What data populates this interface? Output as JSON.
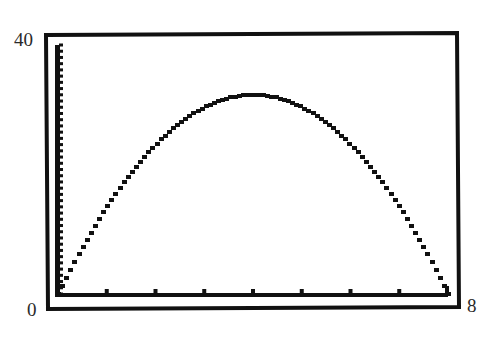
{
  "chart_data": {
    "type": "line",
    "title": "",
    "xlabel": "",
    "ylabel": "",
    "xlim": [
      0,
      8
    ],
    "ylim": [
      0,
      40
    ],
    "x_tick_step": 1,
    "y_tick_step": 1,
    "grid": false,
    "legend": null,
    "function": "y = 16x - 2x^2",
    "x": [
      0,
      0.5,
      1,
      1.5,
      2,
      2.5,
      3,
      3.5,
      4,
      4.5,
      5,
      5.5,
      6,
      6.5,
      7,
      7.5,
      8
    ],
    "series": [
      {
        "name": "y",
        "values": [
          0,
          7.5,
          14,
          19.5,
          24,
          27.5,
          30,
          31.5,
          32,
          31.5,
          30,
          27.5,
          24,
          19.5,
          14,
          7.5,
          0
        ]
      }
    ],
    "corner_labels": {
      "y_max": "40",
      "origin": "0",
      "x_max": "8"
    }
  },
  "colors": {
    "ink": "#111111",
    "background": "#ffffff",
    "label": "#2a2a2a"
  }
}
